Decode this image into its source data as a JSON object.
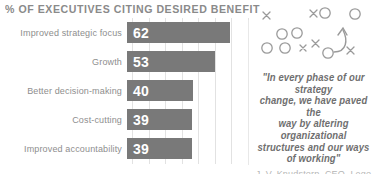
{
  "header": {
    "title": "% OF EXECUTIVES CITING DESIRED BENEFIT"
  },
  "chart_data": {
    "type": "bar",
    "orientation": "horizontal",
    "title": "% OF EXECUTIVES CITING DESIRED BENEFIT",
    "xlabel": "",
    "ylabel": "",
    "xlim": [
      0,
      70
    ],
    "grid": true,
    "grid_axis": "x",
    "gridline_step": 10,
    "legend": "none",
    "categories": [
      "Improved strategic focus",
      "Growth",
      "Better decision-making",
      "Cost-cutting",
      "Improved accountability"
    ],
    "values": [
      62,
      53,
      40,
      39,
      39
    ],
    "value_labels": [
      "62",
      "53",
      "40",
      "39",
      "39"
    ],
    "bar_color": "#797979",
    "label_color": "#8e8e8e",
    "value_label_color": "#ffffff"
  },
  "quote_panel": {
    "quote_lines": [
      "\"In every phase of our strategy",
      "change, we have paved the",
      "way by altering organizational",
      "structures and our ways",
      "of working\""
    ],
    "attribution": "J. V. Knudstorp, CEO, Lego"
  },
  "play_diagram": {
    "name": "football-play-diagram",
    "stroke_color": "#9a9a9a",
    "x_markers": 5,
    "o_markers": 7,
    "has_arrow": true
  },
  "colors": {
    "background": "#ffffff",
    "title": "#8a8a8a",
    "bar": "#797979",
    "gridline": "#e2e2e2",
    "divider": "#e8e8e8",
    "quote_text": "#6f6f6f",
    "attribution": "#b6b6b6",
    "diagram": "#9a9a9a"
  }
}
